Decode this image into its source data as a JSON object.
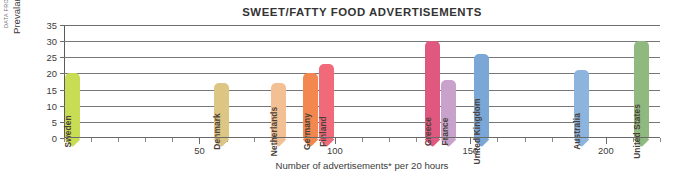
{
  "figure": {
    "title": "SWEET/FATTY FOOD ADVERTISEMENTS",
    "source_credit": "DATA FROM LOBSTEIN AND DIBB. 2005.",
    "y_axis_title": "Prevalance (%) of overweight",
    "x_axis_title": "Number of advertisements* per 20 hours"
  },
  "chart_data": {
    "type": "scatter",
    "title": "SWEET/FATTY FOOD ADVERTISEMENTS",
    "xlabel": "Number of advertisements* per 20 hours",
    "ylabel": "Prevalance (%) of overweight",
    "xlim": [
      0,
      220
    ],
    "ylim": [
      0,
      35
    ],
    "xticks": [
      50,
      100,
      150,
      200
    ],
    "xtick_labels": [
      "50",
      "100",
      "150",
      "200"
    ],
    "x_minor_tick_step": 10,
    "yticks": [
      0,
      5,
      10,
      15,
      20,
      25,
      30,
      35
    ],
    "ytick_labels": [
      "0",
      "5",
      "10",
      "15",
      "20",
      "25",
      "30",
      "35"
    ],
    "grid": "horizontal",
    "legend": "none",
    "marker_style": "pin-bar",
    "points": [
      {
        "label": "Sweden",
        "x": 3,
        "y": 20,
        "color": "#c9dd54"
      },
      {
        "label": "Denmark",
        "x": 58,
        "y": 17,
        "color": "#ddc684"
      },
      {
        "label": "Netherlands",
        "x": 79,
        "y": 17,
        "color": "#f3c093"
      },
      {
        "label": "Germany",
        "x": 91,
        "y": 20,
        "color": "#f2874f"
      },
      {
        "label": "Finland",
        "x": 97,
        "y": 23,
        "color": "#f06a7a"
      },
      {
        "label": "Greece",
        "x": 136,
        "y": 30,
        "color": "#e0587f"
      },
      {
        "label": "France",
        "x": 142,
        "y": 18,
        "color": "#c9a2cc"
      },
      {
        "label": "United Kingdom",
        "x": 154,
        "y": 26,
        "color": "#7ba7d7"
      },
      {
        "label": "Australia",
        "x": 191,
        "y": 21,
        "color": "#8cb4dd"
      },
      {
        "label": "United States",
        "x": 213,
        "y": 30,
        "color": "#8fb97e"
      }
    ]
  }
}
